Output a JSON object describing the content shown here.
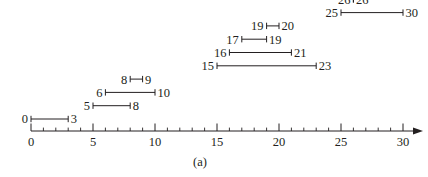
{
  "figure": {
    "caption": "(a)",
    "line_color": "#231f20",
    "text_color": "#231f20",
    "background": "#ffffff"
  },
  "chart_data": {
    "type": "interval-timeline",
    "title": "",
    "subtitle": "",
    "xlabel": "",
    "ylabel": "",
    "xlim": [
      0,
      30
    ],
    "xticks": [
      0,
      5,
      10,
      15,
      20,
      25,
      30
    ],
    "xtick_labels": [
      "0",
      "5",
      "10",
      "15",
      "20",
      "25",
      "30"
    ],
    "minor_tick_step": 1,
    "grid": false,
    "legend": null,
    "axis_arrow": true,
    "annotations": [
      "(a)"
    ],
    "intervals": [
      {
        "row": 0,
        "start": 0,
        "end": 3,
        "start_label": "0",
        "end_label": "3"
      },
      {
        "row": 1,
        "start": 5,
        "end": 8,
        "start_label": "5",
        "end_label": "8"
      },
      {
        "row": 2,
        "start": 6,
        "end": 10,
        "start_label": "6",
        "end_label": "10"
      },
      {
        "row": 3,
        "start": 8,
        "end": 9,
        "start_label": "8",
        "end_label": "9"
      },
      {
        "row": 4,
        "start": 15,
        "end": 23,
        "start_label": "15",
        "end_label": "23"
      },
      {
        "row": 5,
        "start": 16,
        "end": 21,
        "start_label": "16",
        "end_label": "21"
      },
      {
        "row": 6,
        "start": 17,
        "end": 19,
        "start_label": "17",
        "end_label": "19"
      },
      {
        "row": 7,
        "start": 19,
        "end": 20,
        "start_label": "19",
        "end_label": "20"
      },
      {
        "row": 8,
        "start": 25,
        "end": 30,
        "start_label": "25",
        "end_label": "30"
      },
      {
        "row": 9,
        "start": 26,
        "end": 26,
        "start_label": "26",
        "end_label": "26"
      }
    ]
  }
}
